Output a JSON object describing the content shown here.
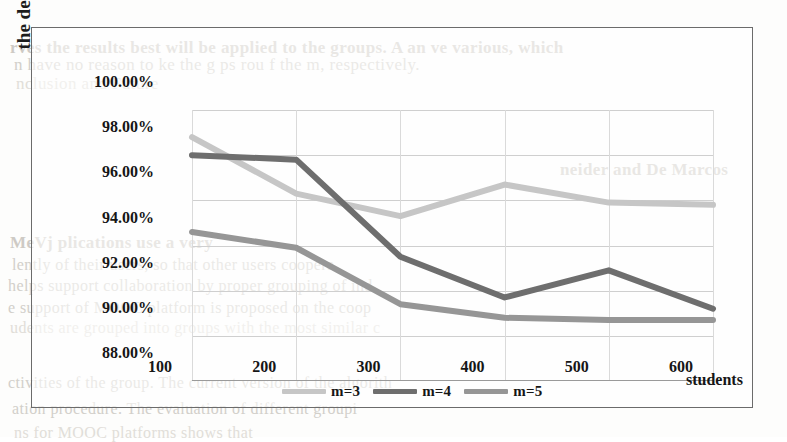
{
  "chart_data": {
    "type": "line",
    "title": "",
    "xlabel": "students",
    "ylabel": "the decline of variance of groups",
    "categories": [
      100,
      200,
      300,
      400,
      500,
      600
    ],
    "x_tick_labels": [
      "100",
      "200",
      "300",
      "400",
      "500",
      "600"
    ],
    "y_tick_labels": [
      "100.00%",
      "98.00%",
      "96.00%",
      "94.00%",
      "92.00%",
      "90.00%",
      "88.00%"
    ],
    "y_tick_values": [
      100.0,
      98.0,
      96.0,
      94.0,
      92.0,
      90.0,
      88.0
    ],
    "ylim": [
      88.0,
      100.0
    ],
    "xlim": [
      100,
      600
    ],
    "grid": true,
    "legend_position": "bottom",
    "units": "percent",
    "series": [
      {
        "name": "m=3",
        "color": "#c6c6c6",
        "values": [
          98.8,
          96.3,
          95.3,
          96.7,
          95.9,
          95.8
        ]
      },
      {
        "name": "m=4",
        "color": "#6e6e6e",
        "values": [
          98.0,
          97.8,
          93.5,
          91.7,
          92.9,
          91.2
        ]
      },
      {
        "name": "m=5",
        "color": "#969696",
        "values": [
          94.6,
          93.9,
          91.4,
          90.8,
          90.7,
          90.7
        ]
      }
    ]
  },
  "legend": {
    "items": [
      {
        "label": "m=3",
        "color": "#c6c6c6"
      },
      {
        "label": "m=4",
        "color": "#6e6e6e"
      },
      {
        "label": "m=5",
        "color": "#969696"
      }
    ]
  },
  "axes": {
    "y_title": "the decline of variance of groups",
    "x_title": "students"
  },
  "background_text": {
    "lines": [
      {
        "text": "rves the results best will be applied to the groups. A an ve  various, which",
        "x": 10,
        "y": 38,
        "size": 17,
        "style": "bold"
      },
      {
        "text": "n have no reason to  ke  the  g  ps  rou  f   the  m,  respectively.",
        "x": 14,
        "y": 55,
        "size": 17,
        "style": "normal"
      },
      {
        "text": "nclusion and Future",
        "x": 16,
        "y": 74,
        "size": 17,
        "style": "faint"
      },
      {
        "text": "neider and  De Marcos",
        "x": 560,
        "y": 160,
        "size": 17,
        "style": "bold"
      },
      {
        "text": "MeVj  plications use a very",
        "x": 10,
        "y": 233,
        "size": 17,
        "style": "bold"
      },
      {
        "text": "lently of their users,  so that  other  users  coopera",
        "x": 12,
        "y": 256,
        "size": 16,
        "style": "normal"
      },
      {
        "text": "helps support collaboration by  proper  grouping of  ind",
        "x": 8,
        "y": 277,
        "size": 16,
        "style": "normal"
      },
      {
        "text": "e  support  of  MOOC  platform  is  proposed  on  the  coop",
        "x": 8,
        "y": 299,
        "size": 16,
        "style": "normal"
      },
      {
        "text": "udents are grouped into  groups  with  the  most  similar  c",
        "x": 10,
        "y": 319,
        "size": 16,
        "style": "faint"
      },
      {
        "text": "ctivities  of  the  group.  The  current  version  of  the  algorith",
        "x": 8,
        "y": 374,
        "size": 16,
        "style": "normal"
      },
      {
        "text": "ation procedure.  The  evaluation  of  different  groupi",
        "x": 12,
        "y": 400,
        "size": 16,
        "style": "normal"
      },
      {
        "text": "ns  for  MOOC  platforms  shows  that",
        "x": 14,
        "y": 424,
        "size": 16,
        "style": "faint"
      }
    ]
  }
}
